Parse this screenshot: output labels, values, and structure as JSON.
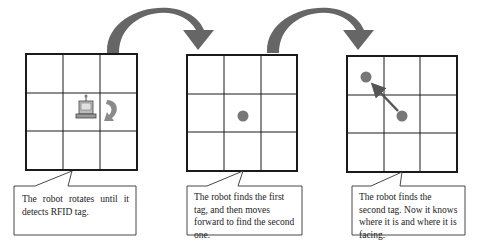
{
  "diagram": {
    "colors": {
      "grid_line": "#1a1a1a",
      "transition_arrow": "#666666",
      "tag_dot": "#777777",
      "move_arrow": "#555555",
      "rotate_arrow": "#8a8a8a",
      "callout_border": "#333333"
    },
    "panels": [
      {
        "id": "step-1",
        "grid": "3x3",
        "content": "robot icon in center cell with rotation arrow in right cell",
        "icons": [
          "robot-icon",
          "rotate-arrow-icon"
        ],
        "caption": "The robot rotates until it detects RFID tag."
      },
      {
        "id": "step-2",
        "grid": "3x3",
        "content": "tag dot in center cell",
        "icons": [
          "rfid-tag-dot-icon"
        ],
        "caption": "The robot finds the first tag, and then moves forward to find the second one."
      },
      {
        "id": "step-3",
        "grid": "3x3",
        "content": "tag dot in center cell, arrow pointing to tag dot in top-left cell",
        "icons": [
          "rfid-tag-dot-icon",
          "rfid-tag-dot-icon",
          "move-arrow-icon"
        ],
        "caption": "The robot finds the second tag. Now it knows where it is and where it is facing."
      }
    ],
    "transitions": [
      {
        "from": "step-1",
        "to": "step-2",
        "icon": "curved-arrow-icon"
      },
      {
        "from": "step-2",
        "to": "step-3",
        "icon": "curved-arrow-icon"
      }
    ]
  }
}
